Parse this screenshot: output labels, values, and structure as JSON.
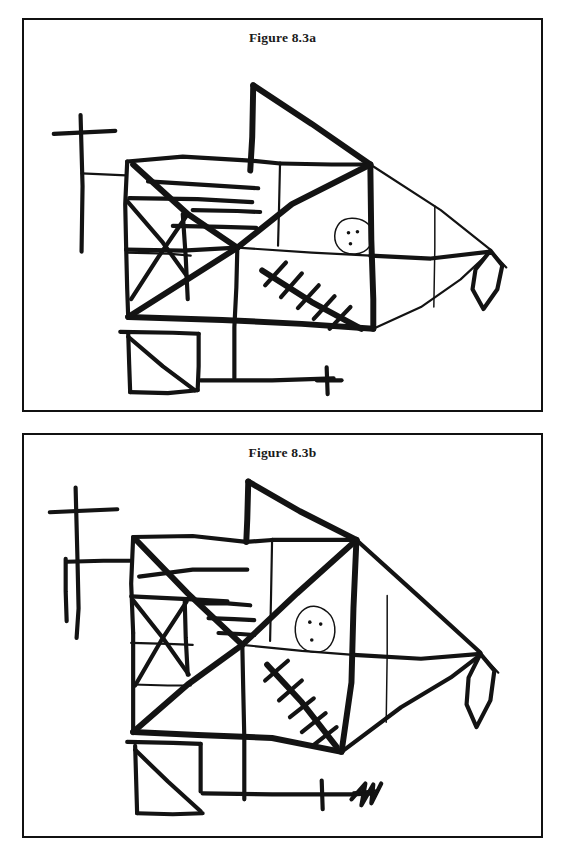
{
  "page": {
    "background_color": "#ffffff",
    "ink_color": "#131313",
    "border_color": "#111111"
  },
  "figures": [
    {
      "id": "figure-8-3a",
      "caption": "Figure 8.3a",
      "description": "Hand-drawn copy of a complex figure resembling a fish",
      "elements": [
        "outer-body-quadrilateral",
        "upper-sail-triangle",
        "left-cross-with-stem",
        "horizontal-ladder-rungs",
        "left-X-cross-hatch",
        "central-diagonal-cross",
        "crosshatched-diagonal-with-ticks",
        "eye-oval-with-three-dots",
        "vertical-divider-line",
        "tail-diamond",
        "bottom-left-square-with-diagonal",
        "bottom-horizontal-line-with-cross"
      ]
    },
    {
      "id": "figure-8-3b",
      "caption": "Figure 8.3b",
      "description": "Second hand-drawn copy of the same complex figure, drawn from memory",
      "elements": [
        "outer-body-quadrilateral",
        "upper-sail-triangle",
        "left-cross-with-connector",
        "horizontal-ladder-rungs",
        "left-X-cross-hatch",
        "central-diagonal-cross",
        "crosshatched-diagonal-with-ticks",
        "eye-oval-with-three-dots",
        "vertical-divider-line",
        "tail-diamond",
        "bottom-left-square-with-diagonal",
        "bottom-horizontal-line-with-tick",
        "bottom-scribble-mark"
      ]
    }
  ]
}
